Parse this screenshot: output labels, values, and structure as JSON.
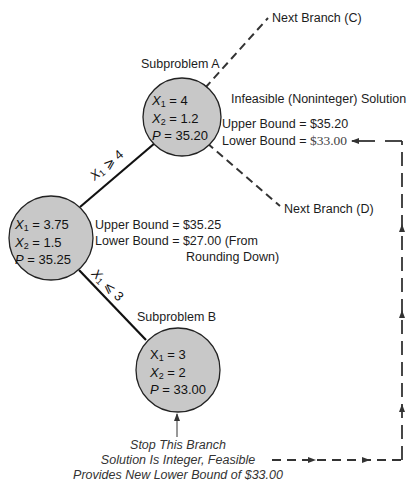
{
  "diagram": {
    "type": "branch-and-bound tree",
    "colors": {
      "node_fill": "#c8c8c8",
      "node_stroke": "#222222",
      "line": "#111111",
      "dashed": "#333333"
    },
    "root": {
      "x1": "3.75",
      "x2": "1.5",
      "p": "35.25",
      "upper_bound_label": "Upper Bound",
      "upper_bound_value": "$35.25",
      "lower_bound_label": "Lower Bound",
      "lower_bound_value": "$27.00 (From",
      "lower_bound_note": "Rounding Down)"
    },
    "subproblem_a": {
      "title": "Subproblem A",
      "x1": "4",
      "x2": "1.2",
      "p": "35.20",
      "status": "Infeasible (Noninteger) Solution",
      "upper_bound_label": "Upper Bound",
      "upper_bound_value": "$35.20",
      "lower_bound_label": "Lower Bound",
      "lower_bound_value": "$33.00"
    },
    "subproblem_b": {
      "title": "Subproblem B",
      "x1": "3",
      "x2": "2",
      "p": "33.00"
    },
    "edges": {
      "to_a": {
        "var": "X",
        "sub": "1",
        "op": "⩾",
        "val": "4"
      },
      "to_b": {
        "var": "X",
        "sub": "1",
        "op": "⩽",
        "val": "3"
      }
    },
    "next_branch_c": "Next Branch (C)",
    "next_branch_d": "Next Branch (D)",
    "note": {
      "line1": "Stop This Branch",
      "line2": "Solution Is Integer, Feasible",
      "line3": "Provides New Lower Bound of $33.00"
    },
    "symbols": {
      "x": "X",
      "p": "P",
      "eq": "=",
      "sub1": "1",
      "sub2": "2"
    }
  }
}
